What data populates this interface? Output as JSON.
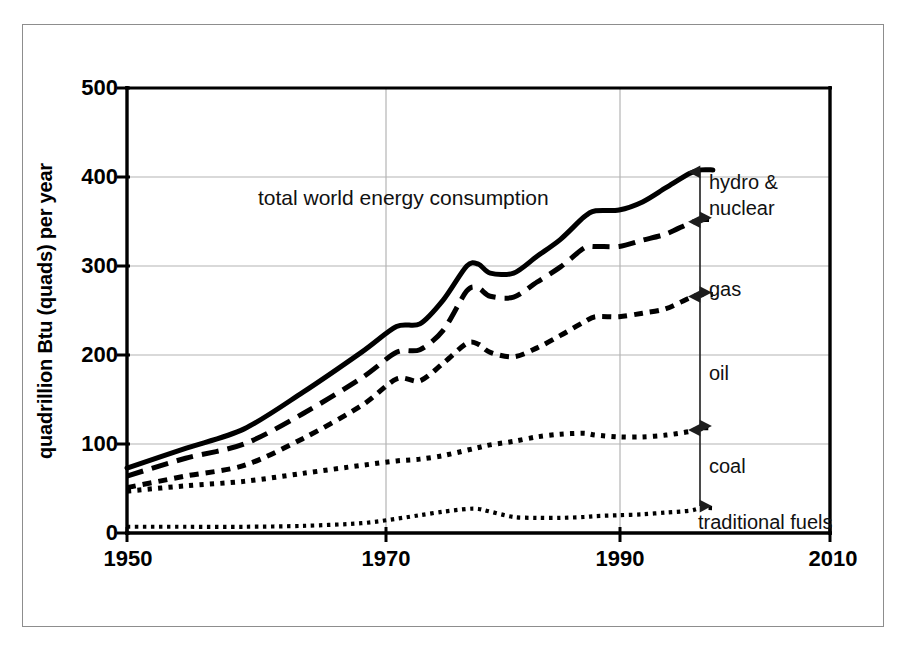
{
  "figure": {
    "background_color": "#ffffff",
    "frame_color": "#8d8d8d",
    "line_color": "#000000",
    "grid_color": "#b4b4b4"
  },
  "axes": {
    "ylabel": "quadrillion Btu (quads) per year",
    "yticks": [
      "0",
      "100",
      "200",
      "300",
      "400",
      "500"
    ],
    "ytick_values": [
      0,
      100,
      200,
      300,
      400,
      500
    ],
    "xticks": [
      "1950",
      "1970",
      "1990",
      "2010"
    ],
    "xtick_values": [
      1950,
      1970,
      1990,
      2010
    ],
    "ylim": [
      0,
      500
    ],
    "xlim": [
      1950,
      2010
    ],
    "grid": "horizontal-and-vertical"
  },
  "annotations": {
    "title": "total world energy consumption",
    "hydro_nuclear": "hydro &",
    "hydro_nuclear_2": "nuclear",
    "gas": "gas",
    "oil": "oil",
    "coal": "coal",
    "traditional_fuels": "traditional fuels"
  },
  "chart_data": {
    "type": "line",
    "title": "total world energy consumption",
    "xlabel": "",
    "ylabel": "quadrillion Btu (quads) per year",
    "xlim": [
      1950,
      2010
    ],
    "ylim": [
      0,
      500
    ],
    "grid": true,
    "legend_position": "inline-right-annotations",
    "x": [
      1950,
      1955,
      1960,
      1965,
      1970,
      1973,
      1975,
      1977,
      1979,
      1980,
      1981,
      1983,
      1985,
      1987,
      1989,
      1990,
      1992,
      1994,
      1996,
      1998,
      1999,
      2000
    ],
    "series": [
      {
        "name": "total world energy consumption",
        "label": "total world energy consumption",
        "style": "solid",
        "cumulative_of": "all sources",
        "values": [
          73,
          95,
          117,
          158,
          203,
          232,
          235,
          262,
          300,
          302,
          292,
          292,
          311,
          330,
          355,
          362,
          363,
          372,
          388,
          404,
          408,
          408
        ]
      },
      {
        "name": "coal + oil + gas + traditional fuels",
        "label": "gas boundary (top of gas band)",
        "style": "dashed-long",
        "values": [
          64,
          84,
          100,
          134,
          174,
          203,
          206,
          228,
          272,
          275,
          266,
          265,
          282,
          299,
          320,
          322,
          322,
          329,
          336,
          348,
          352,
          352
        ]
      },
      {
        "name": "coal + oil + traditional fuels",
        "label": "oil boundary (top of oil band)",
        "style": "dashed-short",
        "values": [
          51,
          64,
          76,
          106,
          143,
          173,
          171,
          191,
          213,
          212,
          203,
          198,
          208,
          222,
          237,
          243,
          243,
          247,
          252,
          264,
          268,
          268
        ]
      },
      {
        "name": "coal + traditional fuels",
        "label": "coal boundary (top of coal band)",
        "style": "dotted",
        "values": [
          47,
          53,
          58,
          67,
          76,
          81,
          83,
          87,
          93,
          96,
          99,
          103,
          108,
          111,
          112,
          110,
          108,
          108,
          110,
          114,
          118,
          118
        ]
      },
      {
        "name": "traditional fuels",
        "label": "traditional fuels",
        "style": "dotted-fine",
        "values": [
          7,
          7,
          7,
          8,
          11,
          16,
          20,
          24,
          27,
          27,
          24,
          18,
          17,
          17,
          18,
          19,
          20,
          21,
          23,
          25,
          28,
          28
        ]
      }
    ],
    "bands": [
      {
        "name": "hydro & nuclear",
        "from": 352,
        "to": 408,
        "at_year": 2000
      },
      {
        "name": "gas",
        "from": 268,
        "to": 352,
        "at_year": 2000
      },
      {
        "name": "oil",
        "from": 118,
        "to": 268,
        "at_year": 2000
      },
      {
        "name": "coal",
        "from": 28,
        "to": 118,
        "at_year": 2000
      },
      {
        "name": "traditional fuels",
        "from": 0,
        "to": 28,
        "at_year": 2000
      }
    ]
  }
}
